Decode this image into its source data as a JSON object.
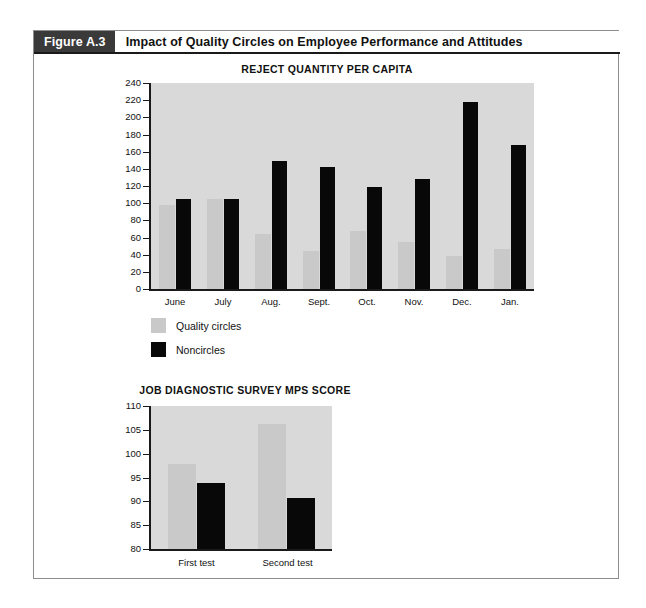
{
  "figure": {
    "number_label": "Figure A.3",
    "title": "Impact of Quality Circles on Employee Performance and Attitudes"
  },
  "legend": {
    "items": [
      {
        "label": "Quality circles",
        "color": "#c9c9c9",
        "swatch": "gray"
      },
      {
        "label": "Noncircles",
        "color": "#080808",
        "swatch": "black"
      }
    ]
  },
  "chart_data": [
    {
      "id": "reject-quantity-per-capita",
      "type": "bar",
      "title": "REJECT QUANTITY PER CAPITA",
      "xlabel": "",
      "ylabel": "",
      "ylim": [
        0,
        240
      ],
      "ytick_step": 20,
      "yticks": [
        0,
        20,
        40,
        60,
        80,
        100,
        120,
        140,
        160,
        180,
        200,
        220,
        240
      ],
      "ytick_labels": [
        "0",
        "20",
        "40",
        "60",
        "80",
        "100",
        "120",
        "140",
        "160",
        "180",
        "200",
        "220",
        "240"
      ],
      "grid": false,
      "legend_position": "below-left",
      "categories": [
        "June",
        "July",
        "Aug.",
        "Sept.",
        "Oct.",
        "Nov.",
        "Dec.",
        "Jan."
      ],
      "series": [
        {
          "name": "Quality circles",
          "color": "#c9c9c9",
          "values": [
            98,
            105,
            64,
            44,
            68,
            55,
            38,
            47
          ]
        },
        {
          "name": "Noncircles",
          "color": "#080808",
          "values": [
            105,
            105,
            149,
            142,
            119,
            128,
            218,
            168
          ]
        }
      ]
    },
    {
      "id": "job-diagnostic-survey-mps-score",
      "type": "bar",
      "title": "JOB DIAGNOSTIC SURVEY MPS SCORE",
      "xlabel": "",
      "ylabel": "",
      "ylim": [
        80,
        110
      ],
      "ytick_step": 5,
      "yticks": [
        80,
        85,
        90,
        95,
        100,
        105,
        110
      ],
      "ytick_labels": [
        "80",
        "85",
        "90",
        "95",
        "100",
        "105",
        "110"
      ],
      "grid": false,
      "legend_position": "shared-above",
      "categories": [
        "First test",
        "Second test"
      ],
      "series": [
        {
          "name": "Quality circles",
          "color": "#c9c9c9",
          "values": [
            97.8,
            106.2
          ]
        },
        {
          "name": "Noncircles",
          "color": "#080808",
          "values": [
            93.8,
            90.7
          ]
        }
      ]
    }
  ]
}
